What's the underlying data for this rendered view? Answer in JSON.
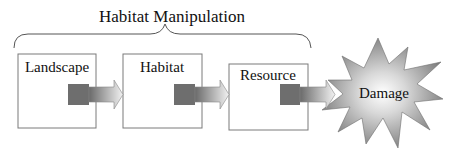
{
  "title": "Habitat Manipulation",
  "boxes": [
    {
      "label": "Landscape"
    },
    {
      "label": "Habitat"
    },
    {
      "label": "Resource"
    }
  ],
  "outcome": {
    "label": "Damage"
  },
  "colors": {
    "box_border": "#7a7a7a",
    "connector_square": "#6e6e6e",
    "arrow_dark": "#6a6a6a",
    "arrow_light": "#f2f2f2",
    "star_outer": "#7d7d7d",
    "star_inner": "#ffffff"
  }
}
